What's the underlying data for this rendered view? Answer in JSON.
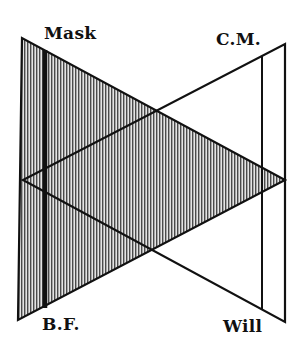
{
  "diagram": {
    "type": "crossed-triangles",
    "labels": {
      "top_left": "Mask",
      "top_right": "C.M.",
      "bottom_left": "B.F.",
      "bottom_right": "Will"
    },
    "colors": {
      "ink": "#111111",
      "background": "#ffffff",
      "hatch_light": "#d8d8d8"
    },
    "shapes": [
      {
        "name": "shaded-triangle",
        "fill": "vertical-hatch",
        "vertices": [
          [
            22,
            38
          ],
          [
            18,
            320
          ],
          [
            285,
            180
          ]
        ]
      },
      {
        "name": "outline-triangle",
        "fill": "none",
        "vertices": [
          [
            285,
            44
          ],
          [
            285,
            322
          ],
          [
            23,
            180
          ]
        ]
      },
      {
        "name": "thick-vertical-bar",
        "x": 45,
        "from": "top edge of shaded triangle",
        "to": "bottom edge of shaded triangle"
      },
      {
        "name": "thin-vertical-line",
        "x": 262,
        "from": "top edge of outline triangle",
        "to": "bottom edge of outline triangle"
      }
    ]
  }
}
